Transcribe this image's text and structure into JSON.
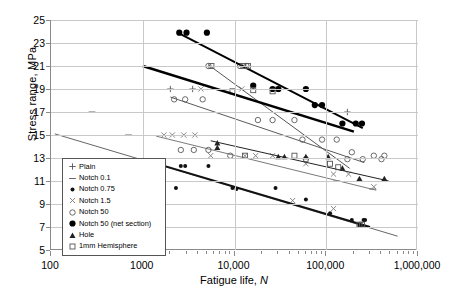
{
  "chart_data": {
    "type": "scatter",
    "title": "",
    "xlabel": "Fatigue life, N",
    "ylabel": "Stress range, MPa",
    "xscale": "log",
    "xlim": [
      100,
      1000000
    ],
    "ylim": [
      5,
      25
    ],
    "xticks": [
      100,
      1000,
      10000,
      100000,
      1000000
    ],
    "xticklabels": [
      "100",
      "1000",
      "10,000",
      "100,000",
      "1,000,000"
    ],
    "yticks": [
      5,
      7,
      9,
      11,
      13,
      15,
      17,
      19,
      21,
      23,
      25
    ],
    "yticklabels": [
      "5",
      "7",
      "9",
      "11",
      "13",
      "15",
      "17",
      "19",
      "21",
      "23",
      "25"
    ],
    "grid": true,
    "legend_position": "lower-left-inside",
    "series": [
      {
        "name": "Plain",
        "marker": "plus",
        "color": "#555555",
        "points": [
          {
            "x": 2000,
            "y": 19
          },
          {
            "x": 3500,
            "y": 19
          },
          {
            "x": 30000,
            "y": 19
          },
          {
            "x": 170000,
            "y": 17
          }
        ],
        "trendline": null
      },
      {
        "name": "Notch 0.1",
        "marker": "dash",
        "color": "#666666",
        "points": [
          {
            "x": 280,
            "y": 17
          },
          {
            "x": 700,
            "y": 15
          },
          {
            "x": 130000,
            "y": 11
          },
          {
            "x": 320000,
            "y": 10.3
          }
        ],
        "trendline": {
          "x1": 110,
          "y1": 15.1,
          "x2": 600000,
          "y2": 6.2
        }
      },
      {
        "name": "Notch 0.75",
        "marker": "small-filled-circle",
        "color": "#111111",
        "points": [
          {
            "x": 1700,
            "y": 12.3
          },
          {
            "x": 2600,
            "y": 12.3
          },
          {
            "x": 2900,
            "y": 12.3
          },
          {
            "x": 5200,
            "y": 12.3
          },
          {
            "x": 2300,
            "y": 10.4
          },
          {
            "x": 9500,
            "y": 10.4
          },
          {
            "x": 10500,
            "y": 10.3
          },
          {
            "x": 28000,
            "y": 10.4
          },
          {
            "x": 60000,
            "y": 9.4
          },
          {
            "x": 110000,
            "y": 8.2
          },
          {
            "x": 190000,
            "y": 7.6
          },
          {
            "x": 230000,
            "y": 7.1
          },
          {
            "x": 245000,
            "y": 7.1
          },
          {
            "x": 255000,
            "y": 7.6
          },
          {
            "x": 265000,
            "y": 7.6
          }
        ],
        "trendline": {
          "x1": 1300,
          "y1": 12.6,
          "x2": 300000,
          "y2": 7.0
        }
      },
      {
        "name": "Notch 1.5",
        "marker": "x",
        "color": "#7a7a7a",
        "points": [
          {
            "x": 1700,
            "y": 15
          },
          {
            "x": 2100,
            "y": 15
          },
          {
            "x": 2800,
            "y": 15
          },
          {
            "x": 3700,
            "y": 15
          },
          {
            "x": 4300,
            "y": 19
          },
          {
            "x": 12000,
            "y": 19
          },
          {
            "x": 30000,
            "y": 19
          },
          {
            "x": 5500,
            "y": 13.2
          },
          {
            "x": 13000,
            "y": 13.2
          },
          {
            "x": 17000,
            "y": 13.2
          },
          {
            "x": 26000,
            "y": 13.2
          },
          {
            "x": 60000,
            "y": 12.5
          },
          {
            "x": 120000,
            "y": 11.6
          },
          {
            "x": 175000,
            "y": 11.6
          },
          {
            "x": 330000,
            "y": 10.5
          },
          {
            "x": 43000,
            "y": 9.3
          },
          {
            "x": 120000,
            "y": 8.6
          }
        ],
        "trendline": {
          "x1": 1400,
          "y1": 14.9,
          "x2": 350000,
          "y2": 10.2
        }
      },
      {
        "name": "Notch 50",
        "marker": "open-circle",
        "color": "#5a5a5a",
        "points": [
          {
            "x": 2200,
            "y": 18.1
          },
          {
            "x": 2900,
            "y": 18.1
          },
          {
            "x": 4500,
            "y": 18.1
          },
          {
            "x": 5200,
            "y": 21
          },
          {
            "x": 11500,
            "y": 21
          },
          {
            "x": 13500,
            "y": 21
          },
          {
            "x": 2600,
            "y": 13.7
          },
          {
            "x": 3600,
            "y": 13.7
          },
          {
            "x": 5200,
            "y": 13.7
          },
          {
            "x": 9000,
            "y": 13.2
          },
          {
            "x": 18000,
            "y": 16.3
          },
          {
            "x": 26000,
            "y": 16.3
          },
          {
            "x": 45000,
            "y": 16.3
          },
          {
            "x": 55000,
            "y": 14.6
          },
          {
            "x": 90000,
            "y": 14.6
          },
          {
            "x": 130000,
            "y": 14.6
          },
          {
            "x": 190000,
            "y": 13.5
          },
          {
            "x": 330000,
            "y": 13.2
          },
          {
            "x": 430000,
            "y": 13.2
          },
          {
            "x": 60000,
            "y": 12.9
          },
          {
            "x": 170000,
            "y": 12.9
          },
          {
            "x": 250000,
            "y": 12.9
          },
          {
            "x": 400000,
            "y": 12.9
          }
        ],
        "trendline": {
          "x1": 2000,
          "y1": 18.3,
          "x2": 260000,
          "y2": 12.6
        }
      },
      {
        "name": "Notch 50 (net section)",
        "marker": "filled-circle",
        "color": "#000000",
        "points": [
          {
            "x": 2500,
            "y": 23.9
          },
          {
            "x": 3000,
            "y": 23.9
          },
          {
            "x": 5000,
            "y": 23.9
          },
          {
            "x": 16000,
            "y": 19.3
          },
          {
            "x": 26000,
            "y": 19.0
          },
          {
            "x": 30000,
            "y": 19.0
          },
          {
            "x": 60000,
            "y": 19.0
          },
          {
            "x": 75000,
            "y": 17.6
          },
          {
            "x": 90000,
            "y": 17.6
          },
          {
            "x": 150000,
            "y": 16.0
          },
          {
            "x": 210000,
            "y": 16.0
          },
          {
            "x": 245000,
            "y": 16.0
          }
        ],
        "trendline": {
          "x1": 2400,
          "y1": 23.9,
          "x2": 250000,
          "y2": 15.6
        }
      },
      {
        "name": "Hole",
        "marker": "triangle",
        "color": "#222222",
        "points": [
          {
            "x": 6500,
            "y": 14.3
          },
          {
            "x": 6500,
            "y": 13.9
          },
          {
            "x": 30000,
            "y": 13.1
          },
          {
            "x": 35000,
            "y": 13.1
          },
          {
            "x": 60000,
            "y": 13.1
          },
          {
            "x": 105000,
            "y": 13.1
          },
          {
            "x": 150000,
            "y": 12.1
          },
          {
            "x": 230000,
            "y": 11.2
          },
          {
            "x": 430000,
            "y": 11.2
          }
        ],
        "trendline": {
          "x1": 5500,
          "y1": 14.5,
          "x2": 480000,
          "y2": 11.0
        }
      },
      {
        "name": "1mm Hemisphere",
        "marker": "open-square",
        "color": "#555555",
        "points": [
          {
            "x": 5600,
            "y": 21
          },
          {
            "x": 12500,
            "y": 21
          },
          {
            "x": 14000,
            "y": 21
          },
          {
            "x": 9500,
            "y": 18.8
          },
          {
            "x": 16000,
            "y": 18.9
          },
          {
            "x": 26000,
            "y": 18.8
          },
          {
            "x": 13000,
            "y": 13.2
          },
          {
            "x": 45000,
            "y": 13.2
          },
          {
            "x": 110000,
            "y": 12.5
          },
          {
            "x": 135000,
            "y": 12.2
          },
          {
            "x": 230000,
            "y": 7.2
          },
          {
            "x": 245000,
            "y": 7.2
          }
        ],
        "trendline": {
          "x1": 5200,
          "y1": 21.1,
          "x2": 180000,
          "y2": 12.1
        }
      }
    ],
    "legend_entries": [
      {
        "label": "Plain",
        "marker": "plus"
      },
      {
        "label": "Notch 0.1",
        "marker": "dash"
      },
      {
        "label": "Notch 0.75",
        "marker": "small-filled-circle"
      },
      {
        "label": "Notch 1.5",
        "marker": "x"
      },
      {
        "label": "Notch 50",
        "marker": "open-circle"
      },
      {
        "label": "Notch 50 (net section)",
        "marker": "filled-circle"
      },
      {
        "label": "Hole",
        "marker": "triangle"
      },
      {
        "label": "1mm Hemisphere",
        "marker": "open-square"
      }
    ],
    "colors": {
      "grid": "#c9c9c9",
      "axis": "#8a8a8a",
      "background": "#ffffff",
      "primary_line": "#000000"
    }
  }
}
